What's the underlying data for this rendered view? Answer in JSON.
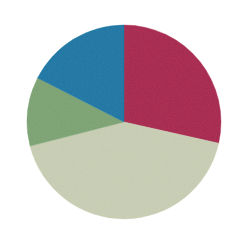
{
  "figure": {
    "background_color": "#ffffff",
    "width": 236,
    "height": 244
  },
  "chart_data": {
    "type": "pie",
    "title": "",
    "subtitle": "",
    "xlabel": "",
    "ylabel": "",
    "grid": false,
    "legend_position": "none",
    "labels_shown": false,
    "start_angle_deg": 0,
    "direction": "clockwise",
    "center": {
      "x": 124,
      "y": 122
    },
    "radius": 97,
    "categories": [
      "Segment 1",
      "Segment 2",
      "Segment 3",
      "Segment 4"
    ],
    "values": [
      28.5,
      42.5,
      11.5,
      17.5
    ],
    "colors": [
      "#a8284e",
      "#c9cfb4",
      "#7ba372",
      "#1a76a4"
    ],
    "slices": [
      {
        "name": "Segment 1",
        "value": 28.5,
        "percent": "28.5%",
        "color": "#a8284e",
        "color_name": "crimson",
        "start_angle_deg": 0,
        "end_angle_deg": 102.6
      },
      {
        "name": "Segment 2",
        "value": 42.5,
        "percent": "42.5%",
        "color": "#c9cfb4",
        "color_name": "pale-sage",
        "start_angle_deg": 102.6,
        "end_angle_deg": 255.6
      },
      {
        "name": "Segment 3",
        "value": 11.5,
        "percent": "11.5%",
        "color": "#7ba372",
        "color_name": "sage-green",
        "start_angle_deg": 255.6,
        "end_angle_deg": 297.0
      },
      {
        "name": "Segment 4",
        "value": 17.5,
        "percent": "17.5%",
        "color": "#1a76a4",
        "color_name": "teal-blue",
        "start_angle_deg": 297.0,
        "end_angle_deg": 360.0
      }
    ]
  }
}
